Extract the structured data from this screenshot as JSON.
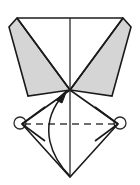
{
  "figure": {
    "title": "origami-fold-step-diagram",
    "type": "origami-instruction-diagram",
    "canvas": {
      "width": 140,
      "height": 185,
      "background": "#ffffff"
    },
    "colors": {
      "paper_shaded": "#d5d5d5",
      "paper_white": "#ffffff",
      "stroke": "#1a1a1a",
      "crease_dashed": "#3c3c3c",
      "arrow": "#1a1a1a",
      "rotation_marker": "#2b2b2b"
    },
    "geometry": {
      "top_edge": {
        "from": [
          17,
          18
        ],
        "to": [
          123,
          18
        ]
      },
      "center_apex": [
        70,
        90
      ],
      "bottom_vertex": [
        70,
        177
      ],
      "left_vertex": [
        22,
        124
      ],
      "right_vertex": [
        118,
        124
      ],
      "vertical_center_line": {
        "from": [
          70,
          18
        ],
        "to": [
          70,
          177
        ]
      },
      "left_shaded_flap": [
        [
          17,
          18
        ],
        [
          70,
          90
        ],
        [
          28,
          96
        ],
        [
          9,
          27
        ]
      ],
      "right_shaded_flap": [
        [
          123,
          18
        ],
        [
          131,
          27
        ],
        [
          112,
          96
        ],
        [
          70,
          90
        ]
      ],
      "left_white_flap": [
        [
          70,
          90
        ],
        [
          22,
          124
        ],
        [
          70,
          177
        ]
      ],
      "right_white_flap": [
        [
          70,
          90
        ],
        [
          118,
          124
        ],
        [
          70,
          177
        ]
      ]
    },
    "elements": {
      "shaded_flap_left": {
        "label": "left shaded flap",
        "fill": "#d5d5d5"
      },
      "shaded_flap_right": {
        "label": "right shaded flap",
        "fill": "#d5d5d5"
      },
      "white_diamond": {
        "label": "lower white diamond",
        "fill": "#ffffff"
      },
      "horizontal_crease": {
        "label": "horizontal valley crease",
        "style": "dashed",
        "from": [
          24,
          124
        ],
        "to": [
          116,
          124
        ],
        "dash_pattern": "7 5"
      },
      "vertical_crease": {
        "label": "vertical center crease",
        "style": "solid",
        "from": [
          70,
          18
        ],
        "to": [
          70,
          177
        ]
      },
      "fold_arrow": {
        "label": "curved fold arrow",
        "description": "curved arrow from bottom vertex up to center apex",
        "start": [
          70,
          177
        ],
        "end": [
          66,
          93
        ],
        "control": [
          40,
          140
        ],
        "head": "solid-filled-triangle"
      },
      "rotation_marker_left": {
        "label": "left rotation/pivot circle marker",
        "center": [
          20,
          123
        ],
        "radius": 6
      },
      "rotation_marker_right": {
        "label": "right rotation/pivot circle marker",
        "center": [
          120,
          123
        ],
        "radius": 6
      }
    }
  }
}
